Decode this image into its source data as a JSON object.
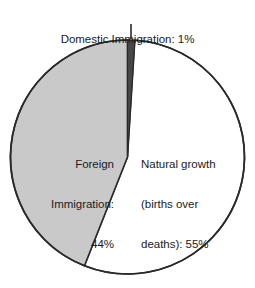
{
  "chart_data": {
    "type": "pie",
    "title": "",
    "xlabel": "",
    "ylabel": "",
    "grid": false,
    "legend_position": "none",
    "total_percent": 100,
    "start_angle_deg": 0,
    "direction": "clockwise",
    "categories": [
      "Domestic Immigration",
      "Natural growth (births over deaths)",
      "Foreign Immigration"
    ],
    "values": [
      1,
      55,
      44
    ],
    "value_unit": "%",
    "slices": [
      {
        "name": "Domestic Immigration",
        "value": 1,
        "value_text": "1%",
        "label_text": "Domestic Immigration: 1%",
        "color": "#474747",
        "start_deg": 0,
        "end_deg": 3.6,
        "label_placement": "outside-top",
        "has_leader_line": true
      },
      {
        "name": "Natural growth (births over deaths)",
        "value": 55,
        "value_text": "55%",
        "label_text": "Natural growth (births over deaths): 55%",
        "color": "#ffffff",
        "start_deg": 3.6,
        "end_deg": 201.6,
        "label_placement": "inside-right",
        "has_leader_line": false
      },
      {
        "name": "Foreign Immigration",
        "value": 44,
        "value_text": "44%",
        "label_text": "Foreign Immigration: 44%",
        "color": "#c9c9c9",
        "start_deg": 201.6,
        "end_deg": 360,
        "label_placement": "inside-left",
        "has_leader_line": false
      }
    ]
  },
  "labels": {
    "title": {
      "text": "Domestic Immigration: 1%"
    },
    "left": {
      "line1": "Foreign",
      "line2": "Immigration:",
      "line3": "44%"
    },
    "right": {
      "line1": "Natural growth",
      "line2": "(births over",
      "line3": "deaths): 55%"
    }
  },
  "colors": {
    "background": "#ffffff",
    "outline": "#2a2a2a",
    "text": "#1b1b1b",
    "slice_domestic": "#474747",
    "slice_natural": "#ffffff",
    "slice_foreign": "#c9c9c9",
    "leader_line": "#2a2a2a"
  },
  "geometry": {
    "center_x": 127.5,
    "center_y": 157,
    "radius": 117,
    "leader_x": 131,
    "leader_y_top": 24,
    "leader_y_bottom": 39
  }
}
